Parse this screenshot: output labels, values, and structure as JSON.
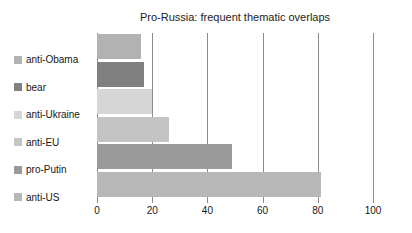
{
  "chart_data": {
    "type": "bar",
    "orientation": "horizontal",
    "title": "Pro-Russia: frequent thematic overlaps",
    "xlabel": "",
    "ylabel": "",
    "xlim": [
      0,
      100
    ],
    "ylim": null,
    "grid": true,
    "legend_position": "left",
    "xticks": [
      0,
      20,
      40,
      60,
      80,
      100
    ],
    "xtick_labels": [
      "0",
      "20",
      "40",
      "60",
      "80",
      "100"
    ],
    "categories": [
      "anti-Obama",
      "bear",
      "anti-Ukraine",
      "anti-EU",
      "pro-Putin",
      "anti-US"
    ],
    "values": [
      16,
      17,
      20,
      26,
      49,
      81
    ],
    "bar_colors": [
      "#b2b2b2",
      "#808080",
      "#d6d6d6",
      "#c4c4c4",
      "#9a9a9a",
      "#b8b8b8"
    ],
    "legend_entries": [
      {
        "label": "anti-Obama",
        "color": "#b2b2b2",
        "value": 16
      },
      {
        "label": "bear",
        "color": "#808080",
        "value": 17
      },
      {
        "label": "anti-Ukraine",
        "color": "#d6d6d6",
        "value": 20
      },
      {
        "label": "anti-EU",
        "color": "#c4c4c4",
        "value": 26
      },
      {
        "label": "pro-Putin",
        "color": "#9a9a9a",
        "value": 49
      },
      {
        "label": "anti-US",
        "color": "#b8b8b8",
        "value": 81
      }
    ],
    "axis_color": "#8c8c8c",
    "background": "#ffffff"
  }
}
